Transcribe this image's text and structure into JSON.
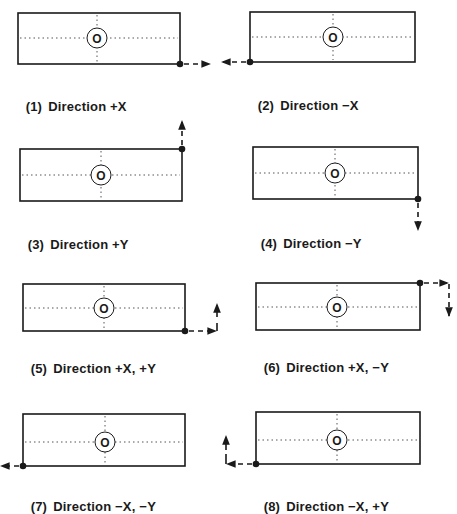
{
  "panels": [
    {
      "id": 1,
      "number": "(1)",
      "caption": "Direction +X",
      "direction": "+X"
    },
    {
      "id": 2,
      "number": "(2)",
      "caption": "Direction −X",
      "direction": "-X"
    },
    {
      "id": 3,
      "number": "(3)",
      "caption": "Direction +Y",
      "direction": "+Y"
    },
    {
      "id": 4,
      "number": "(4)",
      "caption": "Direction −Y",
      "direction": "-Y"
    },
    {
      "id": 5,
      "number": "(5)",
      "caption": "Direction +X, +Y",
      "direction": "+X,+Y"
    },
    {
      "id": 6,
      "number": "(6)",
      "caption": "Direction +X, −Y",
      "direction": "+X,-Y"
    },
    {
      "id": 7,
      "number": "(7)",
      "caption": "Direction −X, −Y",
      "direction": "-X,-Y"
    },
    {
      "id": 8,
      "number": "(8)",
      "caption": "Direction −X, +Y",
      "direction": "-X,+Y"
    }
  ],
  "origin_label": "O",
  "colors": {
    "ink": "#1a1a1a",
    "dotted": "#555555",
    "background": "#ffffff"
  }
}
